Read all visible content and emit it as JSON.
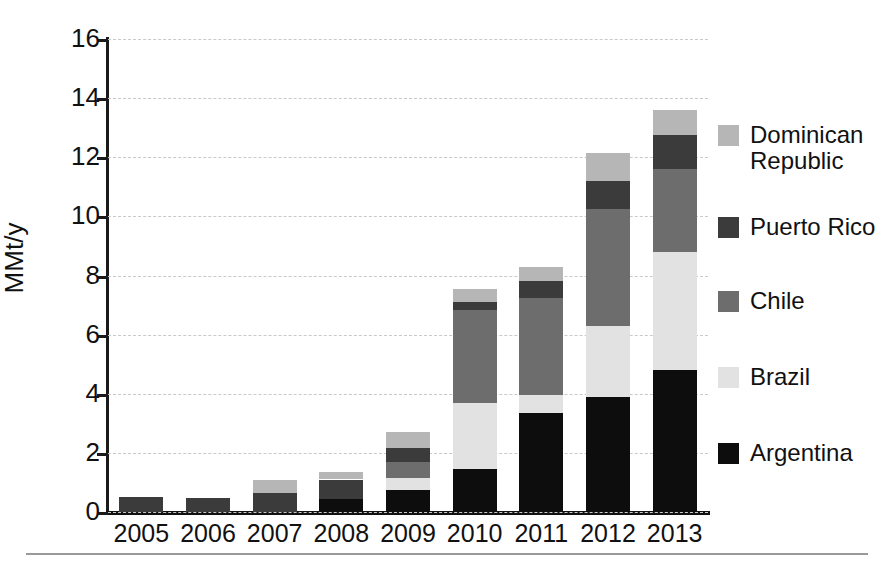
{
  "axes": {
    "y_title": "MMt/y",
    "y_ticks": [
      "0",
      "2",
      "4",
      "6",
      "8",
      "10",
      "12",
      "14",
      "16"
    ],
    "x_ticks": [
      "2005",
      "2006",
      "2007",
      "2008",
      "2009",
      "2010",
      "2011",
      "2012",
      "2013"
    ]
  },
  "legend": {
    "position": "right",
    "items": [
      {
        "label": "Dominican\nRepublic",
        "color": "#b6b6b6",
        "name": "dominican-republic"
      },
      {
        "label": "Puerto Rico",
        "color": "#3b3b3b",
        "name": "puerto-rico"
      },
      {
        "label": "Chile",
        "color": "#6d6d6d",
        "name": "chile"
      },
      {
        "label": "Brazil",
        "color": "#e2e2e2",
        "name": "brazil"
      },
      {
        "label": "Argentina",
        "color": "#0d0d0d",
        "name": "argentina"
      }
    ]
  },
  "chart_data": {
    "type": "bar",
    "stacked": true,
    "title": "",
    "xlabel": "",
    "ylabel": "MMt/y",
    "ylim": [
      0,
      16
    ],
    "ytick_step": 2,
    "grid": "horizontal-dashed",
    "categories": [
      "2005",
      "2006",
      "2007",
      "2008",
      "2009",
      "2010",
      "2011",
      "2012",
      "2013"
    ],
    "series": [
      {
        "name": "Argentina",
        "color": "#0d0d0d",
        "values": [
          0.0,
          0.0,
          0.0,
          0.45,
          0.75,
          1.45,
          3.35,
          3.9,
          4.8
        ]
      },
      {
        "name": "Brazil",
        "color": "#e2e2e2",
        "values": [
          0.0,
          0.0,
          0.0,
          0.0,
          0.4,
          2.25,
          0.6,
          2.4,
          4.0
        ]
      },
      {
        "name": "Chile",
        "color": "#6d6d6d",
        "values": [
          0.0,
          0.0,
          0.0,
          0.0,
          0.55,
          3.15,
          3.3,
          3.95,
          2.8
        ]
      },
      {
        "name": "Puerto Rico",
        "color": "#3b3b3b",
        "values": [
          0.5,
          0.47,
          0.65,
          0.65,
          0.45,
          0.25,
          0.55,
          0.95,
          1.15
        ]
      },
      {
        "name": "Dominican Republic",
        "color": "#b6b6b6",
        "values": [
          0.0,
          0.0,
          0.45,
          0.27,
          0.55,
          0.45,
          0.5,
          0.95,
          0.85
        ]
      }
    ],
    "totals": [
      0.5,
      0.47,
      1.1,
      1.37,
      2.7,
      7.55,
      8.3,
      11.2,
      13.6
    ]
  }
}
